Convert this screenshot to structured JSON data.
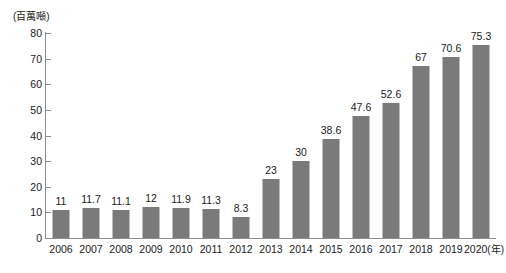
{
  "chart_data": {
    "type": "bar",
    "title": "",
    "subtitle": "",
    "unit_label": "(百萬噸)",
    "xlabel": "(年)",
    "ylabel": "",
    "ylim": [
      0,
      80
    ],
    "ytick_step": 10,
    "yticks": [
      "80",
      "70",
      "60",
      "50",
      "40",
      "30",
      "20",
      "10",
      "0"
    ],
    "grid": false,
    "legend": false,
    "legend_position": "none",
    "bar_color": "#7a7a7a",
    "axis_color": "#8c8c8c",
    "background_color": "#ffffff",
    "text_color": "#1a1a1a",
    "categories": [
      "2006",
      "2007",
      "2008",
      "2009",
      "2010",
      "2011",
      "2012",
      "2013",
      "2014",
      "2015",
      "2016",
      "2017",
      "2018",
      "2019",
      "2020"
    ],
    "values": [
      11,
      11.7,
      11.1,
      12,
      11.9,
      11.3,
      8.3,
      23,
      30,
      38.6,
      47.6,
      52.6,
      67,
      70.6,
      75.3
    ],
    "value_labels": [
      "11",
      "11.7",
      "11.1",
      "12",
      "11.9",
      "11.3",
      "8.3",
      "23",
      "30",
      "38.6",
      "47.6",
      "52.6",
      "67",
      "70.6",
      "75.3"
    ]
  }
}
